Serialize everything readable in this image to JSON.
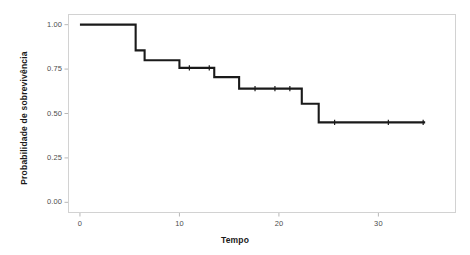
{
  "chart_data": {
    "type": "line",
    "subtype": "kaplan-meier-step",
    "title": "",
    "xlabel": "Tempo",
    "ylabel": "Probabilidade de sobrevivência",
    "xlim": [
      -1.2,
      37.8
    ],
    "ylim": [
      -0.06,
      1.06
    ],
    "xticks": [
      0,
      10,
      20,
      30
    ],
    "xtick_labels": [
      "0",
      "10",
      "20",
      "30"
    ],
    "yticks": [
      0.0,
      0.25,
      0.5,
      0.75,
      1.0
    ],
    "ytick_labels": [
      "0.00",
      "0.25",
      "0.50",
      "0.75",
      "1.00"
    ],
    "grid": false,
    "legend": false,
    "line_color": "#1a1a1a",
    "line_width": 2.1,
    "panel_border_color": "#d2d2d2",
    "background": "#ffffff",
    "series": [
      {
        "name": "survival",
        "step_times": [
          0,
          5.6,
          6.5,
          10.0,
          13.5,
          16.0,
          22.3,
          24.0,
          34.7
        ],
        "step_values": [
          1.0,
          0.855,
          0.8,
          0.757,
          0.705,
          0.64,
          0.555,
          0.45,
          0.45
        ]
      }
    ],
    "censor_marks": [
      {
        "t": 11.0,
        "s": 0.757
      },
      {
        "t": 13.0,
        "s": 0.757
      },
      {
        "t": 17.6,
        "s": 0.64
      },
      {
        "t": 19.6,
        "s": 0.64
      },
      {
        "t": 21.1,
        "s": 0.64
      },
      {
        "t": 25.6,
        "s": 0.45
      },
      {
        "t": 31.0,
        "s": 0.45
      },
      {
        "t": 34.5,
        "s": 0.45
      }
    ]
  },
  "axes": {
    "x_title": "Tempo",
    "y_title": "Probabilidade de sobrevivência"
  }
}
